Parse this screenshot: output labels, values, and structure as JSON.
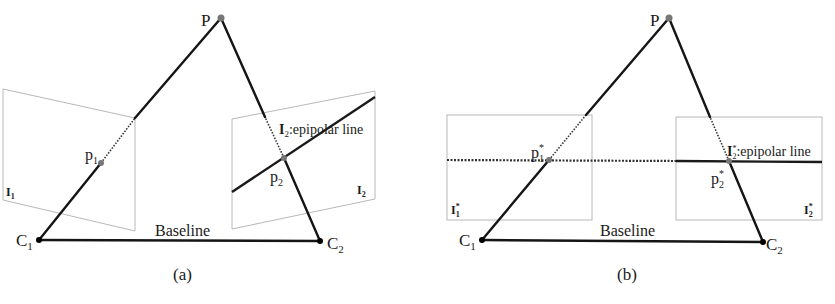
{
  "figure": {
    "panels": [
      {
        "id": "a",
        "caption": "(a)",
        "point_P": "P",
        "camera_left": {
          "label": "C",
          "sub": "1"
        },
        "camera_right": {
          "label": "C",
          "sub": "2"
        },
        "baseline_label": "Baseline",
        "image_left": {
          "label": "I",
          "sub": "1"
        },
        "image_right": {
          "label": "I",
          "sub": "2"
        },
        "proj_left": {
          "label": "p",
          "sub": "1"
        },
        "proj_right": {
          "label": "p",
          "sub": "2"
        },
        "epipolar": {
          "label": "I",
          "sub": "2",
          "text": ":epipolar line"
        }
      },
      {
        "id": "b",
        "caption": "(b)",
        "point_P": "P",
        "camera_left": {
          "label": "C",
          "sub": "1"
        },
        "camera_right": {
          "label": "C",
          "sub": "2"
        },
        "baseline_label": "Baseline",
        "image_left": {
          "label": "I",
          "sup": "*",
          "sub": "1"
        },
        "image_right": {
          "label": "I",
          "sup": "*",
          "sub": "2"
        },
        "proj_left": {
          "label": "p",
          "sup": "*",
          "sub": "1"
        },
        "proj_right": {
          "label": "p",
          "sup": "*",
          "sub": "2"
        },
        "epipolar": {
          "label": "I",
          "sup": "*",
          "sub": "2",
          "text": ":epipolar line"
        }
      }
    ]
  }
}
